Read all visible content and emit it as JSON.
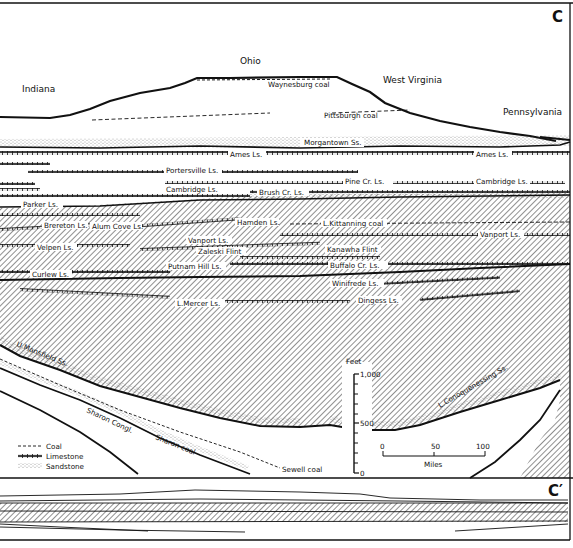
{
  "figure": {
    "panel_top_label": "C",
    "panel_bottom_label": "C′",
    "colors": {
      "ink": "#111111",
      "paper": "#ffffff",
      "hatch": "#333333"
    }
  },
  "states": [
    {
      "name": "Indiana",
      "x": 22,
      "y": 92
    },
    {
      "name": "Ohio",
      "x": 247,
      "y": 62
    },
    {
      "name": "West Virginia",
      "x": 383,
      "y": 82
    },
    {
      "name": "Pennsylvania",
      "x": 503,
      "y": 114
    }
  ],
  "units": [
    {
      "text": "Waynesburg coal",
      "x": 268,
      "y": 83,
      "type": "coal"
    },
    {
      "text": "Pittsburgh coal",
      "x": 324,
      "y": 116,
      "type": "coal"
    },
    {
      "text": "Morgantown Ss.",
      "x": 306,
      "y": 144,
      "type": "sandstone"
    },
    {
      "text": "Ames Ls.",
      "x": 230,
      "y": 154,
      "type": "limestone"
    },
    {
      "text": "Ames Ls.",
      "x": 478,
      "y": 154,
      "type": "limestone"
    },
    {
      "text": "Portersville Ls.",
      "x": 166,
      "y": 170,
      "type": "limestone"
    },
    {
      "text": "Pine Cr. Ls.",
      "x": 345,
      "y": 181,
      "type": "limestone"
    },
    {
      "text": "Cambridge Ls.",
      "x": 166,
      "y": 189,
      "type": "limestone"
    },
    {
      "text": "Cambridge Ls.",
      "x": 476,
      "y": 181,
      "type": "limestone"
    },
    {
      "text": "Brush Cr. Ls.",
      "x": 259,
      "y": 192,
      "type": "limestone"
    },
    {
      "text": "Parker Ls.",
      "x": 23,
      "y": 204,
      "type": "limestone"
    },
    {
      "text": "Brereton Ls.",
      "x": 44,
      "y": 224,
      "type": "limestone"
    },
    {
      "text": "Alum Cove Ls.",
      "x": 92,
      "y": 226,
      "type": "limestone"
    },
    {
      "text": "Hamden Ls.",
      "x": 237,
      "y": 222,
      "type": "limestone"
    },
    {
      "text": "L.Kittanning coal",
      "x": 323,
      "y": 223,
      "type": "coal"
    },
    {
      "text": "Velpen Ls.",
      "x": 37,
      "y": 247,
      "type": "limestone"
    },
    {
      "text": "Vanport Ls.",
      "x": 188,
      "y": 240,
      "type": "limestone"
    },
    {
      "text": "Vanport Ls.",
      "x": 480,
      "y": 234,
      "type": "limestone"
    },
    {
      "text": "Zaleski Flint",
      "x": 198,
      "y": 251,
      "type": "flint"
    },
    {
      "text": "Kanawha Flint",
      "x": 327,
      "y": 249,
      "type": "flint"
    },
    {
      "text": "Putnam Hill Ls.",
      "x": 168,
      "y": 266,
      "type": "limestone"
    },
    {
      "text": "Buffalo Cr. Ls.",
      "x": 330,
      "y": 265,
      "type": "limestone"
    },
    {
      "text": "Curlew Ls.",
      "x": 32,
      "y": 274,
      "type": "limestone"
    },
    {
      "text": "Winifrede Ls.",
      "x": 332,
      "y": 283,
      "type": "limestone"
    },
    {
      "text": "L.Mercer Ls.",
      "x": 177,
      "y": 303,
      "type": "limestone"
    },
    {
      "text": "Dingess Ls.",
      "x": 358,
      "y": 300,
      "type": "limestone"
    },
    {
      "text": "U.Mansfield Ss.",
      "x": 16,
      "y": 349,
      "type": "sandstone"
    },
    {
      "text": "L.Conoquenessing Ss.",
      "x": 440,
      "y": 402,
      "type": "sandstone"
    },
    {
      "text": "Sharon Congl.",
      "x": 88,
      "y": 411,
      "type": "sandstone"
    },
    {
      "text": "Sharon coal",
      "x": 155,
      "y": 440,
      "type": "coal"
    },
    {
      "text": "Sewell coal",
      "x": 282,
      "y": 470,
      "type": "coal"
    }
  ],
  "legend": {
    "items": [
      {
        "label": "Coal",
        "pattern": "dashed-line"
      },
      {
        "label": "Limestone",
        "pattern": "double-tick-line"
      },
      {
        "label": "Sandstone",
        "pattern": "stippled"
      }
    ]
  },
  "vertical_scale": {
    "title": "Feet",
    "ticks": [
      "1,000",
      "500",
      "0"
    ]
  },
  "horizontal_scale": {
    "title": "Miles",
    "ticks": [
      "0",
      "50",
      "100"
    ]
  }
}
